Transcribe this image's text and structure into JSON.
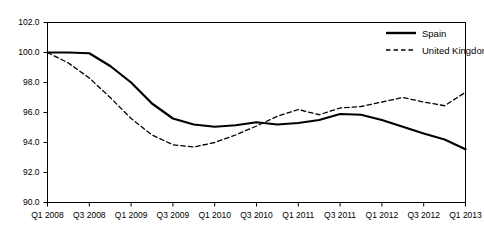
{
  "chart_data": {
    "type": "line",
    "title": "",
    "subtitle": "",
    "xlabel": "",
    "ylabel": "",
    "ylim": [
      90.0,
      102.0
    ],
    "ytick_step": 2.0,
    "ytick_labels": [
      "102.0",
      "100.0",
      "98.0",
      "96.0",
      "94.0",
      "92.0",
      "90.0"
    ],
    "ytick_values": [
      102.0,
      100.0,
      98.0,
      96.0,
      94.0,
      92.0,
      90.0
    ],
    "xtick_labels": [
      "Q1 2008",
      "Q3 2008",
      "Q1 2009",
      "Q3 2009",
      "Q1 2010",
      "Q3 2010",
      "Q1 2011",
      "Q3 2011",
      "Q1 2012",
      "Q3 2012",
      "Q1 2013"
    ],
    "x": [
      "Q1 2008",
      "Q2 2008",
      "Q3 2008",
      "Q4 2008",
      "Q1 2009",
      "Q2 2009",
      "Q3 2009",
      "Q4 2009",
      "Q1 2010",
      "Q2 2010",
      "Q3 2010",
      "Q4 2010",
      "Q1 2011",
      "Q2 2011",
      "Q3 2011",
      "Q4 2011",
      "Q1 2012",
      "Q2 2012",
      "Q3 2012",
      "Q4 2012",
      "Q1 2013"
    ],
    "grid": false,
    "legend_position": "top-right",
    "series": [
      {
        "name": "Spain",
        "style": "solid",
        "color": "#000000",
        "values": [
          100.0,
          100.0,
          99.95,
          99.1,
          98.0,
          96.6,
          95.6,
          95.2,
          95.05,
          95.15,
          95.35,
          95.2,
          95.3,
          95.5,
          95.9,
          95.85,
          95.5,
          95.05,
          94.6,
          94.2,
          93.55
        ]
      },
      {
        "name": "United Kingdom",
        "style": "dashed",
        "color": "#000000",
        "values": [
          100.0,
          99.3,
          98.3,
          97.0,
          95.6,
          94.5,
          93.85,
          93.7,
          94.0,
          94.5,
          95.1,
          95.75,
          96.2,
          95.85,
          96.3,
          96.4,
          96.7,
          97.0,
          96.7,
          96.45,
          97.35
        ]
      }
    ]
  },
  "legend": {
    "items": [
      {
        "label": "Spain",
        "style": "solid"
      },
      {
        "label": "United Kingdom",
        "style": "dashed"
      }
    ]
  }
}
